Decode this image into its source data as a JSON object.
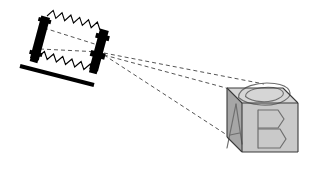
{
  "figure": {
    "background_color": "#ffffff",
    "width": 320,
    "height": 170
  },
  "colors": {
    "ink": "#000000",
    "dashed_ray": "#555555",
    "cube_outline": "#3a3a3a",
    "cube_top_face": "#d6d6d6",
    "cube_front_face": "#c9c9c9",
    "cube_left_face": "#a6a6a6",
    "letter_stroke": "#6e6e6e",
    "background": "#ffffff"
  },
  "apparatus": {
    "name": "optical bench",
    "rail_label": "optical-bench-rail",
    "lamp_label": "lamp-housing",
    "lens_label": "lens-housing",
    "ray_bundle_label": "zigzag-light-rays",
    "rail": {
      "x1": 20,
      "y1": 66,
      "x2": 94,
      "y2": 85,
      "thickness": 4
    },
    "lamp": {
      "cx": 40,
      "cy": 38,
      "width": 9,
      "height": 44,
      "angle": 15
    },
    "lens": {
      "cx": 99,
      "cy": 50,
      "width": 9,
      "height": 42,
      "angle": 15
    },
    "zigzags": [
      {
        "name": "upper-zigzag",
        "x1": 47,
        "y1": 16,
        "x2": 100,
        "y2": 30,
        "amplitude": 7,
        "cycles": 6
      },
      {
        "name": "lower-zigzag",
        "x1": 38,
        "y1": 57,
        "x2": 93,
        "y2": 72,
        "amplitude": 7,
        "cycles": 6
      }
    ],
    "internal_dashes": [
      {
        "name": "upper-axis-dash",
        "x1": 44,
        "y1": 28,
        "x2": 101,
        "y2": 46
      },
      {
        "name": "lower-axis-dash",
        "x1": 40,
        "y1": 49,
        "x2": 101,
        "y2": 52
      }
    ]
  },
  "projection": {
    "name": "projection cone",
    "origin": {
      "x": 104,
      "y": 55
    },
    "rays": [
      {
        "name": "upper-projection-ray",
        "x1": 104,
        "y1": 55,
        "x2": 241,
        "y2": 92
      },
      {
        "name": "lower-projection-ray",
        "x1": 104,
        "y1": 55,
        "x2": 230,
        "y2": 137
      },
      {
        "name": "upper-projection-ray-edge",
        "x1": 104,
        "y1": 53,
        "x2": 264,
        "y2": 84
      }
    ],
    "dash_pattern": "4 3"
  },
  "cube": {
    "name": "labeled cube",
    "faces": [
      {
        "id": "left",
        "letter": "A",
        "shade": "#a6a6a6"
      },
      {
        "id": "front",
        "letter": "B",
        "shade": "#c9c9c9"
      },
      {
        "id": "top",
        "letter": "C",
        "shade": "#d6d6d6"
      }
    ],
    "letters": {
      "left_face": "A",
      "front_face": "B",
      "top_face": "C"
    },
    "geometry": {
      "front_top_left": {
        "x": 242,
        "y": 103
      },
      "front_top_right": {
        "x": 298,
        "y": 103
      },
      "front_bottom_right": {
        "x": 298,
        "y": 152
      },
      "front_bottom_left": {
        "x": 242,
        "y": 152
      },
      "back_top_left": {
        "x": 227,
        "y": 88
      },
      "back_top_right": {
        "x": 283,
        "y": 88
      },
      "back_bottom_left": {
        "x": 227,
        "y": 137
      }
    }
  }
}
